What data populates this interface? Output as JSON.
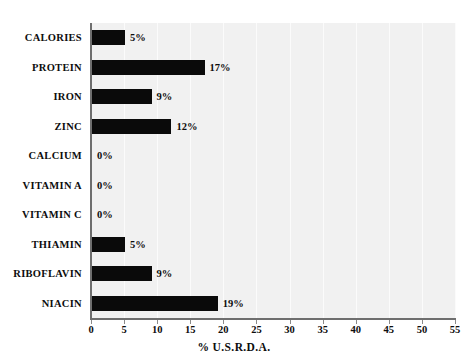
{
  "chart_data": {
    "type": "bar",
    "orientation": "horizontal",
    "title": "",
    "subtitle": "",
    "xlabel": "% U.S.R.D.A.",
    "ylabel": "",
    "xlim": [
      0,
      55
    ],
    "xticks": [
      0,
      5,
      10,
      15,
      20,
      25,
      30,
      35,
      40,
      45,
      50,
      55
    ],
    "xtick_labels": [
      "0",
      "5",
      "10",
      "15",
      "20",
      "25",
      "30",
      "35",
      "40",
      "45",
      "50",
      "55"
    ],
    "grid": true,
    "grid_axis": "x",
    "legend": false,
    "legend_position": "none",
    "bar_color": "#0a0a0a",
    "plot_background": "#f1f1f1",
    "categories": [
      "CALORIES",
      "PROTEIN",
      "IRON",
      "ZINC",
      "CALCIUM",
      "VITAMIN A",
      "VITAMIN C",
      "THIAMIN",
      "RIBOFLAVIN",
      "NIACIN"
    ],
    "values": [
      5,
      17,
      9,
      12,
      0,
      0,
      0,
      5,
      9,
      19
    ],
    "data_labels": [
      "5%",
      "17%",
      "9%",
      "12%",
      "0%",
      "0%",
      "0%",
      "5%",
      "9%",
      "19%"
    ],
    "bars": [
      {
        "category": "CALORIES",
        "value": 5,
        "label": "5%"
      },
      {
        "category": "PROTEIN",
        "value": 17,
        "label": "17%"
      },
      {
        "category": "IRON",
        "value": 9,
        "label": "9%"
      },
      {
        "category": "ZINC",
        "value": 12,
        "label": "12%"
      },
      {
        "category": "CALCIUM",
        "value": 0,
        "label": "0%"
      },
      {
        "category": "VITAMIN A",
        "value": 0,
        "label": "0%"
      },
      {
        "category": "VITAMIN C",
        "value": 0,
        "label": "0%"
      },
      {
        "category": "THIAMIN",
        "value": 5,
        "label": "5%"
      },
      {
        "category": "RIBOFLAVIN",
        "value": 9,
        "label": "9%"
      },
      {
        "category": "NIACIN",
        "value": 19,
        "label": "19%"
      }
    ]
  }
}
